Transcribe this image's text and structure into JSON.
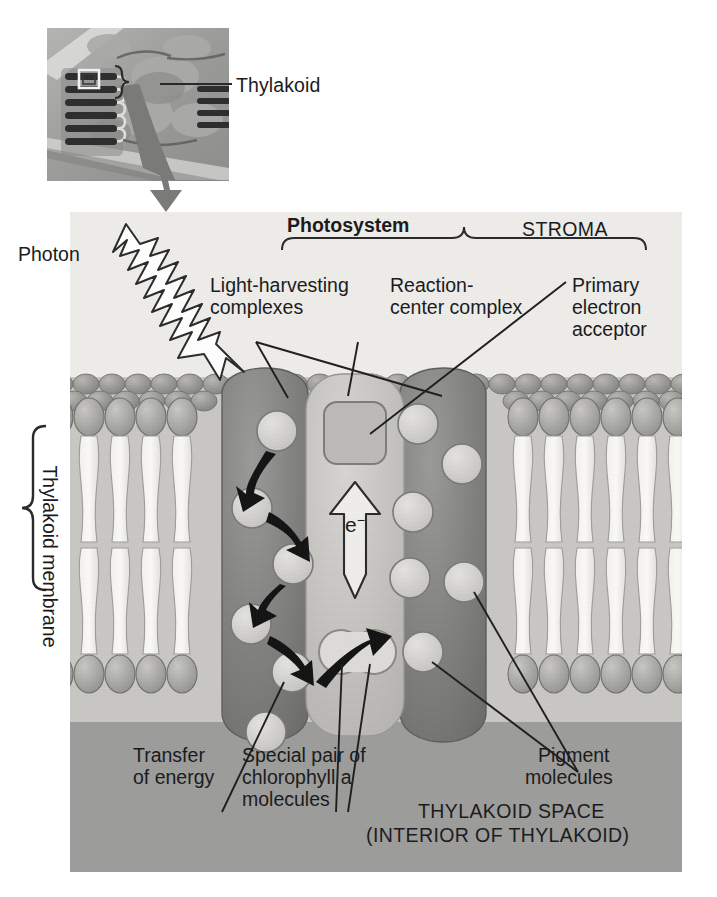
{
  "figure": {
    "type": "biology-diagram",
    "palette": {
      "stroma_bg": "#eeedea",
      "membrane_bg": "#c9c8c5",
      "lumen_bg": "#9d9d9c",
      "complex_fill": "#8a8a88",
      "complex_dark": "#6f6f6d",
      "reaction_center_fill": "#c8c7c3",
      "pigment_fill": "#d7d6d2",
      "arrow_black": "#141414",
      "photon_fill": "#ffffff",
      "text": "#1b1b1b"
    }
  },
  "inset": {
    "label": "Thylakoid",
    "icon": "chloroplast-micrograph",
    "callout_box": "highlight-square"
  },
  "panel": {
    "stroma_label": "STROMA",
    "lumen_label_line1": "THYLAKOID SPACE",
    "lumen_label_line2": "(INTERIOR OF THYLAKOID)",
    "membrane_bracket_label": "Thylakoid membrane",
    "photosystem_bracket_label": "Photosystem",
    "electron_symbol": "e−"
  },
  "labels": {
    "photon": "Photon",
    "light_harvesting_l1": "Light-harvesting",
    "light_harvesting_l2": "complexes",
    "reaction_center_l1": "Reaction-",
    "reaction_center_l2": "center complex",
    "primary_acceptor_l1": "Primary",
    "primary_acceptor_l2": "electron",
    "primary_acceptor_l3": "acceptor",
    "transfer_l1": "Transfer",
    "transfer_l2": "of energy",
    "special_pair_l1": "Special pair of",
    "special_pair_l2": "chlorophyll a",
    "special_pair_l3": "molecules",
    "pigment_l1": "Pigment",
    "pigment_l2": "molecules"
  },
  "structures": {
    "light_harvesting_complexes": 2,
    "reaction_center_complexes": 1,
    "pigment_molecules_left": 5,
    "pigment_molecules_right": 6,
    "energy_transfer_arrows": 5,
    "special_pair_lobes": 2,
    "phospholipid_bilayer_leaflets": 2
  }
}
